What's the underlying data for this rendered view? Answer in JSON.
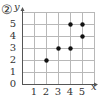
{
  "problem_number": "②",
  "chart_data": {
    "type": "scatter",
    "title": "",
    "xlabel": "x",
    "ylabel": "y",
    "xlim": [
      0,
      6
    ],
    "ylim": [
      0,
      6
    ],
    "x_ticks": [
      "1",
      "2",
      "3",
      "4",
      "5"
    ],
    "y_ticks": [
      "0",
      "1",
      "2",
      "3",
      "4",
      "5"
    ],
    "grid": true,
    "points": [
      {
        "x": 2,
        "y": 2
      },
      {
        "x": 3,
        "y": 3
      },
      {
        "x": 4,
        "y": 3
      },
      {
        "x": 4,
        "y": 5
      },
      {
        "x": 5,
        "y": 5
      },
      {
        "x": 5,
        "y": 4
      }
    ],
    "colors": {
      "grid": "#b8b8b8",
      "axis": "#555555",
      "point": "#111111"
    }
  }
}
